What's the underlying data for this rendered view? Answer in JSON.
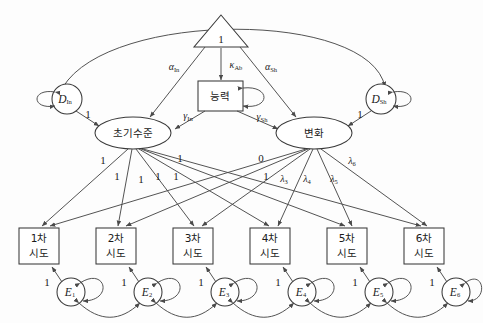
{
  "diagram": {
    "type": "path-diagram",
    "colors": {
      "stroke": "#4a4a4a",
      "text": "#1b1b1b",
      "fill": "#ffffff"
    }
  },
  "constant": {
    "label": "1",
    "shape": "triangle"
  },
  "ability": {
    "label": "능력",
    "shape": "rectangle"
  },
  "disturbances": [
    {
      "id": "d-in",
      "symbol": "D",
      "subscript": "In",
      "loading": "1"
    },
    {
      "id": "d-sh",
      "symbol": "D",
      "subscript": "Sh",
      "loading": "1"
    }
  ],
  "factors": [
    {
      "id": "intercept",
      "label": "초기수준",
      "shape": "ellipse"
    },
    {
      "id": "slope",
      "label": "변화",
      "shape": "ellipse"
    }
  ],
  "paths": {
    "alpha_in": {
      "base": "α",
      "sub": "In"
    },
    "alpha_sh": {
      "base": "α",
      "sub": "Sh"
    },
    "kappa_ab": {
      "base": "κ",
      "sub": "Ab"
    },
    "gamma_in": {
      "base": "γ",
      "sub": "In"
    },
    "gamma_sh": {
      "base": "γ",
      "sub": "Sh"
    }
  },
  "indicators": [
    {
      "id": "t1",
      "label_line1": "1차",
      "label_line2": "시도"
    },
    {
      "id": "t2",
      "label_line1": "2차",
      "label_line2": "시도"
    },
    {
      "id": "t3",
      "label_line1": "3차",
      "label_line2": "시도"
    },
    {
      "id": "t4",
      "label_line1": "4차",
      "label_line2": "시도"
    },
    {
      "id": "t5",
      "label_line1": "5차",
      "label_line2": "시도"
    },
    {
      "id": "t6",
      "label_line1": "6차",
      "label_line2": "시도"
    }
  ],
  "errors": [
    {
      "id": "e1",
      "symbol": "E",
      "subscript": "1",
      "loading": "1"
    },
    {
      "id": "e2",
      "symbol": "E",
      "subscript": "2",
      "loading": "1"
    },
    {
      "id": "e3",
      "symbol": "E",
      "subscript": "3",
      "loading": "1"
    },
    {
      "id": "e4",
      "symbol": "E",
      "subscript": "4",
      "loading": "1"
    },
    {
      "id": "e5",
      "symbol": "E",
      "subscript": "5",
      "loading": "1"
    },
    {
      "id": "e6",
      "symbol": "E",
      "subscript": "6",
      "loading": "1"
    }
  ],
  "intercept_loadings": [
    {
      "value": "1"
    },
    {
      "value": "1"
    },
    {
      "value": "1"
    },
    {
      "value": "1"
    },
    {
      "value": "1"
    },
    {
      "value": "1"
    }
  ],
  "slope_loadings": [
    {
      "value": "0",
      "greek": false
    },
    {
      "value": "1",
      "greek": false
    },
    {
      "base": "λ",
      "sub": "3",
      "greek": true
    },
    {
      "base": "λ",
      "sub": "4",
      "greek": true
    },
    {
      "base": "λ",
      "sub": "5",
      "greek": true
    },
    {
      "base": "λ",
      "sub": "6",
      "greek": true
    }
  ]
}
